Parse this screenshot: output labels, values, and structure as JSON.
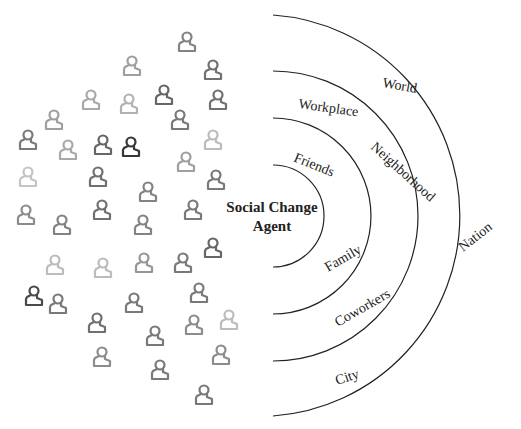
{
  "center_label": [
    "Social Change",
    "Agent"
  ],
  "rings": [
    {
      "name": "ring-1",
      "labels": [
        "Friends",
        "Family"
      ]
    },
    {
      "name": "ring-2",
      "labels": [
        "Workplace",
        "Neighborhood",
        "Coworkers"
      ]
    },
    {
      "name": "ring-3",
      "labels": [
        "World",
        "Nation",
        "City"
      ]
    }
  ],
  "people_icons": [
    [
      187,
      42,
      0.55
    ],
    [
      132,
      66,
      0.4
    ],
    [
      213,
      70,
      0.65
    ],
    [
      91,
      100,
      0.35
    ],
    [
      129,
      104,
      0.3
    ],
    [
      164,
      95,
      0.7
    ],
    [
      218,
      100,
      0.65
    ],
    [
      54,
      120,
      0.4
    ],
    [
      180,
      120,
      0.6
    ],
    [
      28,
      140,
      0.6
    ],
    [
      68,
      150,
      0.35
    ],
    [
      103,
      145,
      0.7
    ],
    [
      131,
      147,
      0.95
    ],
    [
      213,
      140,
      0.25
    ],
    [
      186,
      162,
      0.4
    ],
    [
      98,
      177,
      0.65
    ],
    [
      28,
      177,
      0.2
    ],
    [
      216,
      180,
      0.6
    ],
    [
      148,
      192,
      0.55
    ],
    [
      26,
      215,
      0.5
    ],
    [
      62,
      225,
      0.55
    ],
    [
      102,
      210,
      0.65
    ],
    [
      143,
      225,
      0.55
    ],
    [
      193,
      210,
      0.6
    ],
    [
      213,
      248,
      0.7
    ],
    [
      55,
      265,
      0.25
    ],
    [
      103,
      268,
      0.25
    ],
    [
      144,
      263,
      0.45
    ],
    [
      183,
      263,
      0.6
    ],
    [
      34,
      296,
      0.85
    ],
    [
      58,
      304,
      0.6
    ],
    [
      134,
      303,
      0.6
    ],
    [
      199,
      293,
      0.6
    ],
    [
      97,
      323,
      0.65
    ],
    [
      155,
      336,
      0.6
    ],
    [
      194,
      325,
      0.5
    ],
    [
      229,
      320,
      0.25
    ],
    [
      102,
      357,
      0.5
    ],
    [
      221,
      355,
      0.5
    ],
    [
      160,
      370,
      0.6
    ],
    [
      204,
      395,
      0.6
    ]
  ]
}
